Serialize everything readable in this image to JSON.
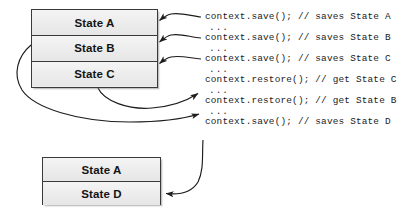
{
  "diagram": {
    "stroke_color": "#3a3a3a",
    "box_fill": "#ececec",
    "text_color": "#141414"
  },
  "top_stack": {
    "name": "state-stack-top",
    "rows": [
      {
        "label": "State A"
      },
      {
        "label": "State B"
      },
      {
        "label": "State C"
      }
    ]
  },
  "bottom_stack": {
    "name": "state-stack-bottom",
    "rows": [
      {
        "label": "State A"
      },
      {
        "label": "State D"
      }
    ]
  },
  "code_lines": [
    {
      "id": "save-a",
      "text": "context.save(); // saves State A"
    },
    {
      "id": "ellipsis1",
      "text": "..."
    },
    {
      "id": "save-b",
      "text": "context.save(); // saves State B"
    },
    {
      "id": "ellipsis2",
      "text": "..."
    },
    {
      "id": "save-c",
      "text": "context.save(); // saves State C"
    },
    {
      "id": "ellipsis3",
      "text": "..."
    },
    {
      "id": "restore-c",
      "text": "context.restore(); // get State C"
    },
    {
      "id": "ellipsis4",
      "text": "..."
    },
    {
      "id": "restore-b",
      "text": "context.restore(); // get State B"
    },
    {
      "id": "ellipsis5",
      "text": "..."
    },
    {
      "id": "save-d",
      "text": "context.save(); // saves State D"
    }
  ],
  "arrows": [
    {
      "id": "arrow-save-a",
      "from": "save-a",
      "to": "State A row",
      "direction": "left"
    },
    {
      "id": "arrow-save-b",
      "from": "save-b",
      "to": "State B row",
      "direction": "left"
    },
    {
      "id": "arrow-save-c",
      "from": "save-c",
      "to": "State C row",
      "direction": "left"
    },
    {
      "id": "arrow-restore-c",
      "from": "State C row",
      "to": "restore-c",
      "direction": "right"
    },
    {
      "id": "arrow-restore-b",
      "from": "State B row",
      "to": "restore-b",
      "direction": "right"
    },
    {
      "id": "arrow-save-d",
      "from": "save-d",
      "to": "State D row",
      "direction": "left"
    }
  ]
}
